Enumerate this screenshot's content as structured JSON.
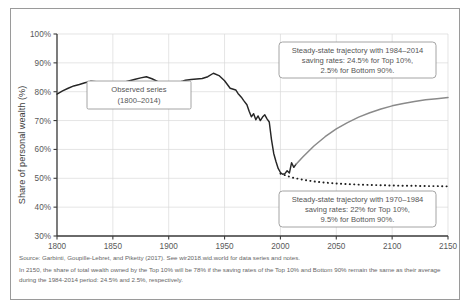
{
  "figure": {
    "notes": [
      "Source: Garbinti, Goupille-Lebret, and Piketty (2017). See wir2018.wid.world for data series and notes.",
      "In 2150, the share of total wealth owned by the Top 10% will be 78% if the saving rates of the Top 10% and Bottom 90% remain the same as their average during the 1984-2014 period: 24.5% and 2.5%, respectively."
    ]
  },
  "chart_data": {
    "type": "line",
    "title": "",
    "xlabel": "",
    "ylabel": "Share of personal wealth (%)",
    "xlim": [
      1800,
      2150
    ],
    "ylim": [
      30,
      100
    ],
    "grid": true,
    "legend_position": "none",
    "xticks": [
      "1800",
      "1850",
      "1900",
      "1950",
      "2000",
      "2050",
      "2100",
      "2150"
    ],
    "xtick_values": [
      1800,
      1850,
      1900,
      1950,
      2000,
      2050,
      2100,
      2150
    ],
    "yticks": [
      "30%",
      "40%",
      "50%",
      "60%",
      "70%",
      "80%",
      "90%",
      "100%"
    ],
    "ytick_values": [
      30,
      40,
      50,
      60,
      70,
      80,
      90,
      100
    ],
    "annotations": [
      {
        "name": "observed-series-label",
        "lines": [
          "Observed series",
          "(1800–2014)"
        ]
      },
      {
        "name": "upper-projection-label",
        "lines": [
          "Steady-state trajectory with 1984–2014",
          "saving rates: 24.5% for Top 10%,",
          "2.5% for Bottom 90%."
        ]
      },
      {
        "name": "lower-projection-label",
        "lines": [
          "Steady-state trajectory with 1970–1984",
          "saving rates: 22% for Top 10%,",
          "9.5% for Bottom 90%."
        ]
      }
    ],
    "series": [
      {
        "name": "Observed series (1800-2014)",
        "style": "solid",
        "color": "#262626",
        "x": [
          1800,
          1805,
          1810,
          1815,
          1820,
          1825,
          1830,
          1835,
          1840,
          1845,
          1850,
          1855,
          1860,
          1865,
          1870,
          1875,
          1880,
          1885,
          1890,
          1895,
          1900,
          1905,
          1910,
          1913,
          1915,
          1920,
          1925,
          1930,
          1935,
          1940,
          1945,
          1950,
          1955,
          1960,
          1962,
          1965,
          1967,
          1970,
          1972,
          1974,
          1976,
          1978,
          1980,
          1982,
          1984,
          1986,
          1988,
          1990,
          1992,
          1994,
          1996,
          1998,
          2000,
          2002,
          2004,
          2006,
          2008,
          2010,
          2012,
          2014
        ],
        "values": [
          79.2,
          80.3,
          81.2,
          82.0,
          82.5,
          83.1,
          83.6,
          83.5,
          83.0,
          82.4,
          82.1,
          82.6,
          83.3,
          83.8,
          84.3,
          84.8,
          85.2,
          84.5,
          83.6,
          83.0,
          82.6,
          83.0,
          83.4,
          83.7,
          84.0,
          84.2,
          84.4,
          84.6,
          85.2,
          86.4,
          85.6,
          83.8,
          81.2,
          80.6,
          79.4,
          78.1,
          77.0,
          75.5,
          73.2,
          71.3,
          72.4,
          70.3,
          71.6,
          70.0,
          71.2,
          72.0,
          70.6,
          69.5,
          63.4,
          58.6,
          55.8,
          53.4,
          52.0,
          51.4,
          51.6,
          52.6,
          51.8,
          55.4,
          53.8,
          54.9
        ]
      },
      {
        "name": "Steady-state trajectory with 1984-2014 saving rates",
        "style": "solid-gray",
        "color": "#8a8a8a",
        "x": [
          2014,
          2020,
          2030,
          2040,
          2050,
          2060,
          2070,
          2080,
          2090,
          2100,
          2110,
          2120,
          2130,
          2140,
          2150
        ],
        "values": [
          54.9,
          57.4,
          61.2,
          64.4,
          67.1,
          69.3,
          71.2,
          72.7,
          74.0,
          75.1,
          75.9,
          76.6,
          77.2,
          77.6,
          78.0
        ]
      },
      {
        "name": "Steady-state trajectory with 1970-1984 saving rates",
        "style": "dotted",
        "color": "#1f1f1f",
        "x": [
          2000,
          2010,
          2020,
          2030,
          2040,
          2050,
          2060,
          2070,
          2080,
          2090,
          2100,
          2110,
          2120,
          2130,
          2140,
          2150
        ],
        "values": [
          51.6,
          50.3,
          49.5,
          48.9,
          48.5,
          48.2,
          48.0,
          47.8,
          47.7,
          47.6,
          47.5,
          47.4,
          47.4,
          47.3,
          47.3,
          47.2
        ]
      }
    ]
  }
}
